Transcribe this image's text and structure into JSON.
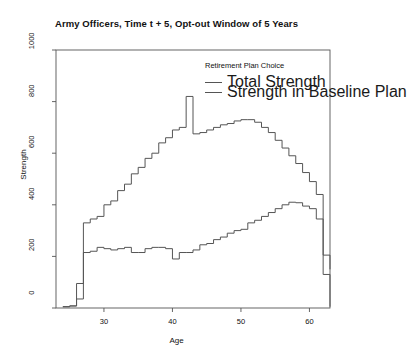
{
  "chart_data": {
    "type": "line",
    "title": "Army Officers, Time t + 5, Opt-out Window of 5 Years",
    "xlabel": "Age",
    "ylabel": "Strength",
    "xlim": [
      23,
      63
    ],
    "ylim": [
      0,
      1000
    ],
    "xticks": [
      30,
      40,
      50,
      60
    ],
    "yticks": [
      0,
      200,
      400,
      600,
      800,
      1000
    ],
    "grid": false,
    "step_style": "hv",
    "legend": {
      "title": "Retirement Plan Choice",
      "position": "top-right-inside",
      "entries": [
        {
          "name": "Total Strength",
          "color": "#555555"
        },
        {
          "name": "Strength in Baseline Plan",
          "color": "#555555"
        }
      ]
    },
    "x": [
      24,
      25,
      26,
      27,
      28,
      29,
      30,
      31,
      32,
      33,
      34,
      35,
      36,
      37,
      38,
      39,
      40,
      41,
      42,
      43,
      44,
      45,
      46,
      47,
      48,
      49,
      50,
      51,
      52,
      53,
      54,
      55,
      56,
      57,
      58,
      59,
      60,
      61,
      62
    ],
    "series": [
      {
        "name": "Total Strength",
        "color": "#555555",
        "values": [
          5,
          8,
          95,
          330,
          345,
          355,
          400,
          415,
          455,
          480,
          520,
          545,
          580,
          600,
          640,
          660,
          690,
          700,
          820,
          675,
          680,
          690,
          700,
          710,
          715,
          725,
          730,
          730,
          720,
          700,
          680,
          650,
          620,
          590,
          560,
          525,
          490,
          440,
          205
        ]
      },
      {
        "name": "Strength in Baseline Plan",
        "color": "#555555",
        "values": [
          5,
          8,
          35,
          215,
          220,
          235,
          230,
          225,
          230,
          235,
          215,
          215,
          230,
          235,
          235,
          230,
          190,
          215,
          215,
          225,
          245,
          250,
          265,
          275,
          290,
          300,
          305,
          330,
          340,
          355,
          370,
          385,
          400,
          410,
          408,
          395,
          385,
          345,
          130
        ]
      }
    ]
  }
}
